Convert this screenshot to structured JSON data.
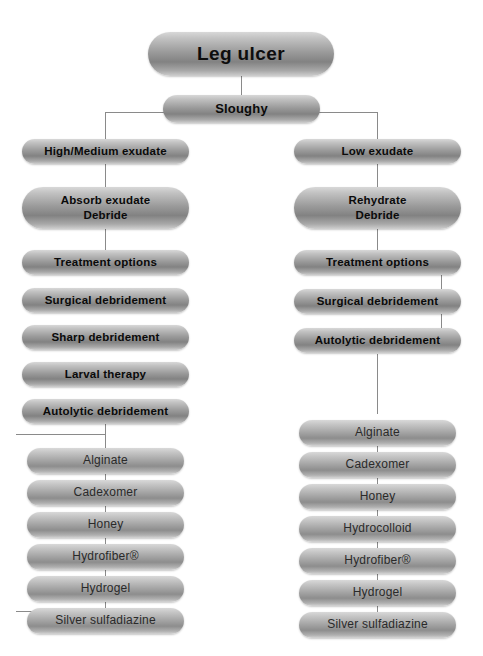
{
  "diagram": {
    "title": "Leg ulcer",
    "root": {
      "label": "Leg ulcer"
    },
    "classification": {
      "label": "Sloughy"
    },
    "branches": [
      {
        "side": "left",
        "exudate": {
          "label": "High/Medium exudate"
        },
        "aim": {
          "line1": "Absorb exudate",
          "line2": "Debride"
        },
        "options_header": {
          "label": "Treatment options"
        },
        "methods": [
          {
            "label": "Surgical debridement"
          },
          {
            "label": "Sharp debridement"
          },
          {
            "label": "Larval therapy"
          },
          {
            "label": "Autolytic debridement"
          }
        ],
        "dressings": [
          {
            "label": "Alginate"
          },
          {
            "label": "Cadexomer"
          },
          {
            "label": "Honey"
          },
          {
            "label": "Hydrofiber®"
          },
          {
            "label": "Hydrogel"
          },
          {
            "label": "Silver sulfadiazine"
          }
        ]
      },
      {
        "side": "right",
        "exudate": {
          "label": "Low exudate"
        },
        "aim": {
          "line1": "Rehydrate",
          "line2": "Debride"
        },
        "options_header": {
          "label": "Treatment options"
        },
        "methods": [
          {
            "label": "Surgical debridement"
          },
          {
            "label": "Autolytic debridement"
          }
        ],
        "dressings": [
          {
            "label": "Alginate"
          },
          {
            "label": "Cadexomer"
          },
          {
            "label": "Honey"
          },
          {
            "label": "Hydrocolloid"
          },
          {
            "label": "Hydrofiber®"
          },
          {
            "label": "Hydrogel"
          },
          {
            "label": "Silver sulfadiazine"
          }
        ]
      }
    ],
    "colors": {
      "node_light": "#d8d8d8",
      "node_dark": "#828282",
      "connector": "#8a8a8a",
      "text": "#0d0d0d",
      "background": "#ffffff"
    }
  }
}
